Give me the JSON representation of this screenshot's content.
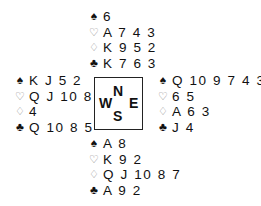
{
  "suit_symbols": {
    "spades": "♠",
    "hearts": "♡",
    "diamonds": "♢",
    "clubs": "♣"
  },
  "compass": {
    "north": "N",
    "west": "W",
    "east": "E",
    "south": "S"
  },
  "hands": {
    "north": {
      "spades": "6",
      "hearts": "A 7 4 3",
      "diamonds": "K 9 5 2",
      "clubs": "K 7 6 3"
    },
    "west": {
      "spades": "K J 5 2",
      "hearts": "Q J 10 8",
      "diamonds": "4",
      "clubs": "Q 10 8 5"
    },
    "east": {
      "spades": "Q 10 9 7 4 3",
      "hearts": "6 5",
      "diamonds": "A 6 3",
      "clubs": "J 4"
    },
    "south": {
      "spades": "A 8",
      "hearts": "K 9 2",
      "diamonds": "Q J 10 8 7",
      "clubs": "A 9 2"
    }
  }
}
